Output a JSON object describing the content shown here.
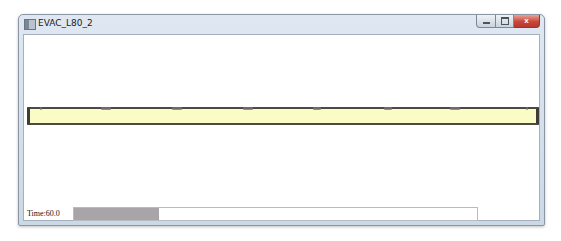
{
  "window": {
    "title": "EVAC_L80_2",
    "icon": "app-icon",
    "caption_buttons": [
      {
        "name": "minimize",
        "icon": "minimize-icon"
      },
      {
        "name": "maximize",
        "icon": "maximize-icon"
      },
      {
        "name": "close",
        "icon": "close-icon",
        "glyph": "x"
      }
    ]
  },
  "simulation": {
    "corridor_color": "#fbfbc6",
    "border_color": "#4c4a42",
    "agents": [
      {
        "x_pct": 2,
        "width": 2
      },
      {
        "x_pct": 14,
        "width": 10
      },
      {
        "x_pct": 28,
        "width": 10
      },
      {
        "x_pct": 42,
        "width": 10
      },
      {
        "x_pct": 56,
        "width": 8
      },
      {
        "x_pct": 70,
        "width": 8
      },
      {
        "x_pct": 83,
        "width": 10
      },
      {
        "x_pct": 98,
        "width": 2
      }
    ]
  },
  "status": {
    "time_label": "Time:60.0",
    "progress_pct": 21,
    "progress_fill_color": "#a8a4a8"
  }
}
